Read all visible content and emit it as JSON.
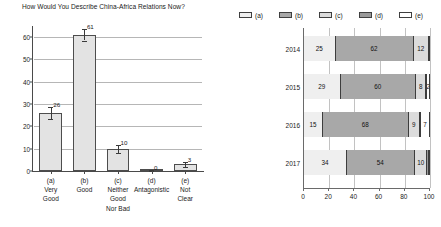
{
  "chart_data": [
    {
      "type": "bar",
      "title": "How Would You Describe China-Africa Relations Now?",
      "xlabel": "",
      "ylabel": "",
      "ylim": [
        0,
        65
      ],
      "yticks": [
        0,
        10,
        20,
        30,
        40,
        50,
        60
      ],
      "grid": true,
      "legend": "none",
      "categories": [
        "(a)",
        "(b)",
        "(c)",
        "(d)",
        "(e)"
      ],
      "category_labels": [
        [
          "(a)",
          "Very",
          "Good"
        ],
        [
          "(b)",
          "Good"
        ],
        [
          "(c)",
          "Neither",
          "Good",
          "Nor Bad"
        ],
        [
          "(d)",
          "Antagonistic"
        ],
        [
          "(e)",
          "Not",
          "Clear"
        ]
      ],
      "values": [
        26,
        61,
        10,
        0,
        3
      ],
      "value_labels": [
        "26",
        "61",
        "10",
        "0",
        "3"
      ],
      "errors": [
        2.5,
        2.5,
        1.8,
        0.6,
        1.2
      ],
      "bar_fill": "#e3e3e3",
      "bar_edge": "#4d4d4d"
    },
    {
      "type": "bar",
      "orientation": "horizontal",
      "stacked": true,
      "title": "",
      "xlabel": "",
      "ylabel": "",
      "xlim": [
        0,
        100
      ],
      "xticks": [
        0,
        20,
        40,
        60,
        80,
        100
      ],
      "xtick_labels": [
        "0",
        "20",
        "40",
        "60",
        "80",
        "100"
      ],
      "grid": true,
      "legend_position": "top",
      "legend": [
        "(a)",
        "(b)",
        "(c)",
        "(d)",
        "(e)"
      ],
      "legend_colors": [
        "#efefef",
        "#a8a8a8",
        "#dcdcdc",
        "#9a9a9a",
        "#ffffff"
      ],
      "categories": [
        "2014",
        "2015",
        "2016",
        "2017"
      ],
      "series": [
        {
          "name": "(a)",
          "values": [
            25,
            29,
            15,
            34
          ]
        },
        {
          "name": "(b)",
          "values": [
            62,
            60,
            68,
            54
          ]
        },
        {
          "name": "(c)",
          "values": [
            12,
            8,
            9,
            10
          ]
        },
        {
          "name": "(d)",
          "values": [
            0,
            2,
            0,
            1
          ]
        },
        {
          "name": "(e)",
          "values": [
            1,
            1,
            7,
            1
          ]
        }
      ],
      "rows": [
        {
          "year": "2014",
          "segments": [
            {
              "key": "(a)",
              "value": 25,
              "label": "25",
              "color": "#efefef"
            },
            {
              "key": "(b)",
              "value": 62,
              "label": "62",
              "color": "#a8a8a8"
            },
            {
              "key": "(c)",
              "value": 12,
              "label": "12",
              "color": "#dcdcdc"
            },
            {
              "key": "(d)",
              "value": 0.6,
              "label": "",
              "color": "#9a9a9a"
            },
            {
              "key": "(e)",
              "value": 0.4,
              "label": "",
              "color": "#ffffff"
            }
          ]
        },
        {
          "year": "2015",
          "segments": [
            {
              "key": "(a)",
              "value": 29,
              "label": "29",
              "color": "#efefef"
            },
            {
              "key": "(b)",
              "value": 60,
              "label": "60",
              "color": "#a8a8a8"
            },
            {
              "key": "(c)",
              "value": 8,
              "label": "8",
              "color": "#dcdcdc"
            },
            {
              "key": "(d)",
              "value": 1,
              "label": "",
              "color": "#9a9a9a"
            },
            {
              "key": "(e)",
              "value": 2,
              "label": "2",
              "color": "#ffffff"
            }
          ]
        },
        {
          "year": "2016",
          "segments": [
            {
              "key": "(a)",
              "value": 15,
              "label": "15",
              "color": "#efefef"
            },
            {
              "key": "(b)",
              "value": 68,
              "label": "68",
              "color": "#a8a8a8"
            },
            {
              "key": "(c)",
              "value": 9,
              "label": "9",
              "color": "#dcdcdc"
            },
            {
              "key": "(d)",
              "value": 1,
              "label": "",
              "color": "#9a9a9a"
            },
            {
              "key": "(e)",
              "value": 7,
              "label": "7",
              "color": "#ffffff"
            }
          ]
        },
        {
          "year": "2017",
          "segments": [
            {
              "key": "(a)",
              "value": 34,
              "label": "34",
              "color": "#efefef"
            },
            {
              "key": "(b)",
              "value": 54,
              "label": "54",
              "color": "#a8a8a8"
            },
            {
              "key": "(c)",
              "value": 10,
              "label": "10",
              "color": "#dcdcdc"
            },
            {
              "key": "(d)",
              "value": 1,
              "label": "",
              "color": "#9a9a9a"
            },
            {
              "key": "(e)",
              "value": 1,
              "label": "",
              "color": "#ffffff"
            }
          ]
        }
      ]
    }
  ]
}
